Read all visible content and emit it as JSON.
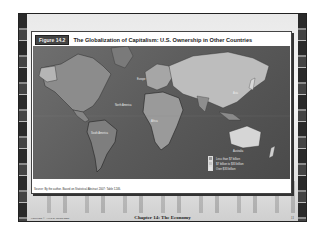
{
  "slide": {
    "figure": {
      "badge": "Figure 14.2",
      "title": "The Globalization of Capitalism: U.S. Ownership in Other Countries",
      "map_labels": {
        "north_america": "North America",
        "south_america": "South America",
        "europe": "Europe",
        "africa": "Africa",
        "asia": "Asia",
        "australia": "Australia"
      },
      "legend": [
        {
          "label": "Less than $7 billion",
          "color": "#9a9a9a"
        },
        {
          "label": "$7 billion to $33 billion",
          "color": "#c4c4c4"
        },
        {
          "label": "Over $33 billion",
          "color": "#e4e4e4"
        }
      ],
      "source": "Source: By the author. Based on Statistical Abstract 2007: Table 1246."
    },
    "footer": {
      "copyright": "Copyright © Allyn & Bacon 2008",
      "chapter": "Chapter 14: The Economy",
      "page": "11"
    }
  }
}
